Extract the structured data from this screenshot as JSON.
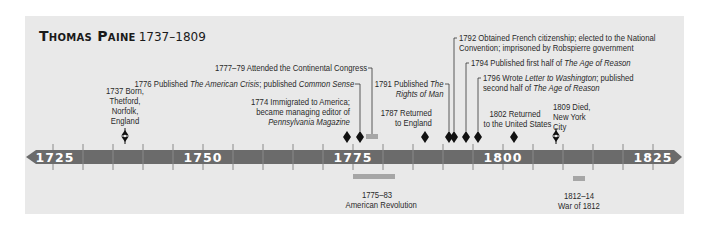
{
  "title": {
    "name": "Thomas Paine",
    "years": "1737–1809"
  },
  "axis": {
    "labels": [
      "1725",
      "1750",
      "1775",
      "1800",
      "1825"
    ],
    "bar_color": "#6b6b6b",
    "tick_color": "#8a8a8a"
  },
  "events": {
    "born": {
      "year": "1737",
      "line1": "1737 Born,",
      "line2": "Thetford,",
      "line3": "Norfolk,",
      "line4": "England"
    },
    "immigrated": {
      "line1": "1774 Immigrated to America;",
      "line2": "became managing editor of",
      "line3": "Pennsylvania Magazine"
    },
    "crisis": {
      "pre": "1776 Published ",
      "italic1": "The American Crisis",
      "mid": "; published ",
      "italic2": "Common Sense"
    },
    "congress": {
      "text": "1777–79 Attended the Continental Congress"
    },
    "returned_england": {
      "line1": "1787 Returned",
      "line2": "to England"
    },
    "rights": {
      "line1_pre": "1791 Published ",
      "line1_italic": "The",
      "line2_italic": "Rights of Man"
    },
    "citizenship": {
      "line1": "1792 Obtained French citizenship; elected to the National",
      "line2": "Convention; imprisoned by Robspierre government"
    },
    "age_reason_1": {
      "pre": "1794 Published first half of ",
      "italic": "The Age of Reason"
    },
    "letter": {
      "line1_pre": "1796 Wrote ",
      "line1_italic": "Letter to Washington",
      "line1_post": "; published",
      "line2_pre": "second half of ",
      "line2_italic": "The Age of Reason"
    },
    "returned_us": {
      "line1": "1802 Returned",
      "line2": "to the United States"
    },
    "died": {
      "line1": "1809 Died,",
      "line2": "New York",
      "line3": "City"
    }
  },
  "periods": {
    "revolution": {
      "line1": "1775–83",
      "line2": "American Revolution"
    },
    "war1812": {
      "line1": "1812–14",
      "line2": "War of 1812"
    }
  }
}
